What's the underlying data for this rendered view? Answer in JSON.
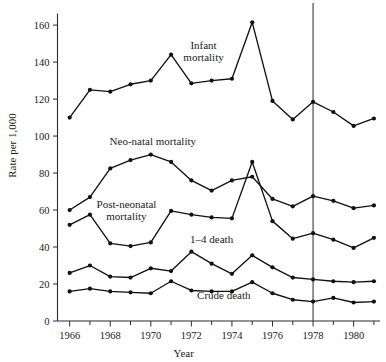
{
  "chart_data": {
    "type": "line",
    "title": "",
    "xlabel": "Year",
    "ylabel": "Rate per 1,000",
    "xlim": [
      1965.4,
      1981.3
    ],
    "ylim": [
      0,
      166
    ],
    "grid": false,
    "legend_position": "inline-labels",
    "x": [
      1966,
      1967,
      1968,
      1969,
      1970,
      1971,
      1972,
      1973,
      1974,
      1975,
      1976,
      1977,
      1978,
      1979,
      1980,
      1981
    ],
    "y_ticks": [
      0,
      20,
      40,
      60,
      80,
      100,
      120,
      140,
      160
    ],
    "y_tick_labels": [
      "0",
      "20",
      "40",
      "60",
      "80",
      "100",
      "120",
      "140",
      "160"
    ],
    "x_ticks_major": [
      1966,
      1968,
      1970,
      1972,
      1974,
      1976,
      1978,
      1980
    ],
    "x_tick_labels": [
      "1966",
      "1968",
      "1970",
      "1972",
      "1974",
      "1976",
      "1978",
      "1980"
    ],
    "x_ticks_minor": [
      1967,
      1969,
      1971,
      1973,
      1975,
      1977,
      1979,
      1981
    ],
    "annotations": [
      {
        "text": "Infant mortality",
        "x": 1972.6,
        "y": 147,
        "align": "middle"
      },
      {
        "text": "Neo-natal mortality",
        "x": 1970.1,
        "y": 95,
        "align": "middle"
      },
      {
        "text": "Post-neonatal mortality",
        "x": 1968.8,
        "y": 61,
        "align": "middle"
      },
      {
        "text": "1–4 death",
        "x": 1973.0,
        "y": 42,
        "align": "middle"
      },
      {
        "text": "Crude death",
        "x": 1973.6,
        "y": 12,
        "align": "middle"
      }
    ],
    "reference_lines": [
      {
        "orientation": "vertical",
        "x": 1978,
        "label": ""
      }
    ],
    "series": [
      {
        "name": "Infant mortality",
        "values": [
          110,
          125,
          124,
          128,
          130,
          144,
          128.5,
          130,
          131,
          161.5,
          119,
          109,
          118.5,
          113,
          105.5,
          109.5
        ]
      },
      {
        "name": "Neo-natal mortality",
        "values": [
          60,
          67,
          82.5,
          87,
          90,
          86,
          76,
          70.5,
          76,
          78,
          66,
          62,
          67.5,
          65,
          61,
          62.5
        ]
      },
      {
        "name": "Post-neonatal mortality",
        "values": [
          52,
          57.5,
          42,
          40.5,
          42.5,
          59.5,
          57.5,
          56,
          55.5,
          86,
          54,
          44.5,
          47.5,
          44,
          39.5,
          45
        ]
      },
      {
        "name": "1–4 death",
        "values": [
          26,
          30,
          24,
          23.5,
          28.5,
          27,
          37.5,
          31,
          25.5,
          35.5,
          29,
          23.5,
          22.5,
          21.5,
          21,
          21.5
        ]
      },
      {
        "name": "Crude death",
        "values": [
          16,
          17.5,
          16,
          15.5,
          15,
          21.5,
          16.5,
          16,
          16,
          21,
          15,
          11.5,
          10.5,
          12.5,
          10,
          10.5
        ]
      }
    ]
  }
}
